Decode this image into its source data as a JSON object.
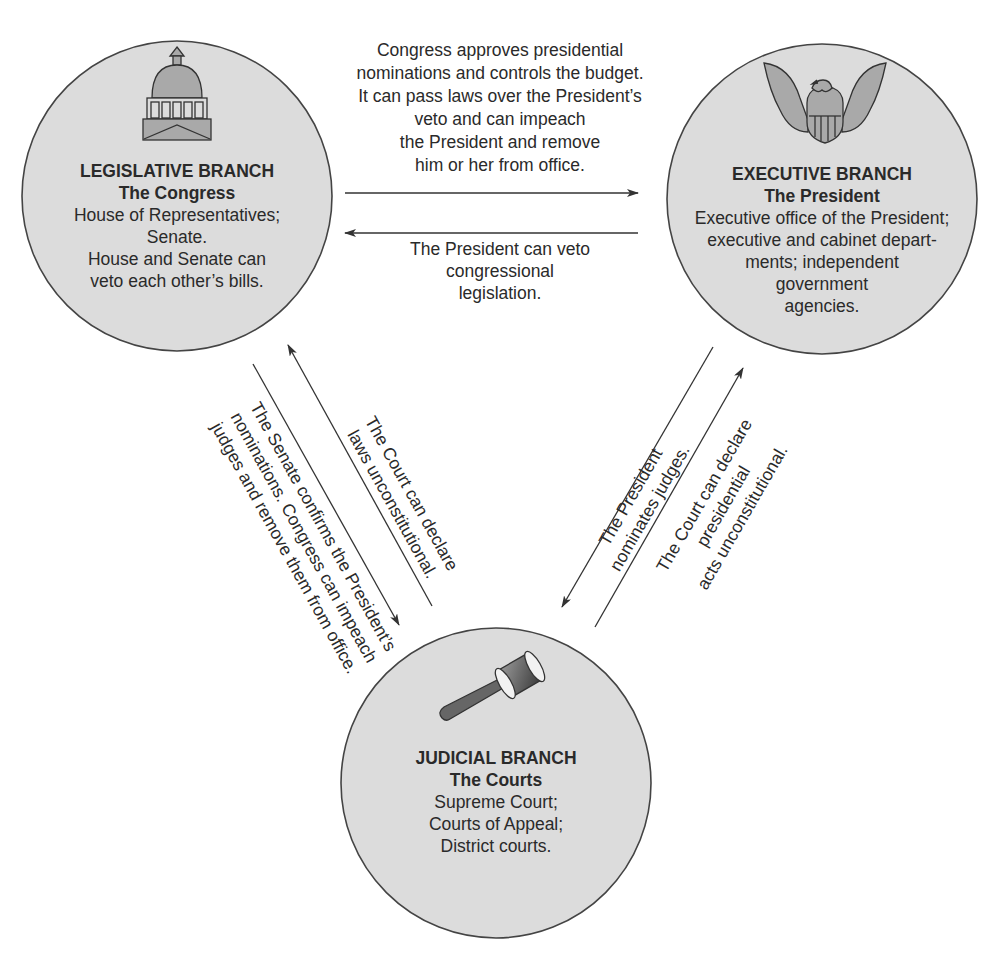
{
  "diagram": {
    "type": "separation-of-powers",
    "colors": {
      "circle_fill": "#dcdcdc",
      "circle_stroke": "#444444",
      "arrow": "#333333",
      "icon_fill": "#a9a9a9",
      "icon_stroke": "#333333"
    },
    "branches": {
      "legislative": {
        "title": "LEGISLATIVE BRANCH",
        "subtitle": "The Congress",
        "lines": [
          "House of Representatives;",
          "Senate.",
          "House and Senate can",
          "veto each other’s bills."
        ],
        "icon": "capitol-dome-icon"
      },
      "executive": {
        "title": "EXECUTIVE BRANCH",
        "subtitle": "The President",
        "lines": [
          "Executive office of the President;",
          "executive and cabinet depart-",
          "ments; independent",
          "government",
          "agencies."
        ],
        "icon": "eagle-seal-icon"
      },
      "judicial": {
        "title": "JUDICIAL BRANCH",
        "subtitle": "The Courts",
        "lines": [
          "Supreme Court;",
          "Courts of Appeal;",
          "District courts."
        ],
        "icon": "gavel-icon"
      }
    },
    "relations": {
      "congress_to_president": {
        "lines": [
          "Congress approves presidential",
          "nominations and controls the budget.",
          "It can pass laws over the President’s",
          "veto and can impeach",
          "the President and remove",
          "him or her from office."
        ]
      },
      "president_to_congress": {
        "lines": [
          "The President can veto",
          "congressional",
          "legislation."
        ]
      },
      "court_to_congress": {
        "lines": [
          "The Court can declare",
          "laws unconstitutional."
        ]
      },
      "congress_to_court": {
        "lines": [
          "The Senate confirms the President’s",
          "nominations. Congress can impeach",
          "judges and remove them from office."
        ]
      },
      "president_to_court": {
        "lines": [
          "The President",
          "nominates judges."
        ]
      },
      "court_to_president": {
        "lines": [
          "The Court can declare",
          "presidential",
          "acts unconstitutional."
        ]
      }
    }
  }
}
